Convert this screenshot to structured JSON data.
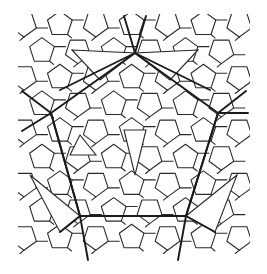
{
  "diagram": {
    "kind": "pentagonal-quasiperiodic-tiling",
    "background": "#ffffff",
    "line_color": "#1a1a1a",
    "heavy_skeleton": {
      "pentagon": [
        [
          135,
          53
        ],
        [
          218,
          113
        ],
        [
          186,
          216
        ],
        [
          80,
          216
        ],
        [
          51,
          113
        ]
      ],
      "spokes": [
        [
          [
            135,
            53
          ],
          [
            124,
            16
          ]
        ],
        [
          [
            135,
            53
          ],
          [
            146,
            16
          ]
        ],
        [
          [
            51,
            113
          ],
          [
            22,
            91
          ]
        ],
        [
          [
            51,
            113
          ],
          [
            22,
            131
          ]
        ],
        [
          [
            218,
            113
          ],
          [
            246,
            91
          ]
        ],
        [
          [
            218,
            113
          ],
          [
            248,
            113
          ]
        ],
        [
          [
            80,
            216
          ],
          [
            60,
            232
          ]
        ],
        [
          [
            80,
            216
          ],
          [
            88,
            260
          ]
        ],
        [
          [
            186,
            216
          ],
          [
            178,
            260
          ]
        ],
        [
          [
            186,
            216
          ],
          [
            215,
            232
          ]
        ],
        [
          [
            135,
            53
          ],
          [
            60,
            90
          ]
        ],
        [
          [
            135,
            53
          ],
          [
            210,
            90
          ]
        ],
        [
          [
            51,
            113
          ],
          [
            80,
            216
          ]
        ],
        [
          [
            218,
            113
          ],
          [
            186,
            216
          ]
        ],
        [
          [
            80,
            216
          ],
          [
            186,
            216
          ]
        ]
      ],
      "thin_triangles": [
        [
          [
            72,
            50
          ],
          [
            135,
            53
          ],
          [
            100,
            80
          ]
        ],
        [
          [
            198,
            50
          ],
          [
            135,
            53
          ],
          [
            170,
            80
          ]
        ],
        [
          [
            30,
            175
          ],
          [
            80,
            216
          ],
          [
            60,
            232
          ]
        ],
        [
          [
            237,
            175
          ],
          [
            186,
            216
          ],
          [
            215,
            232
          ]
        ],
        [
          [
            124,
            130
          ],
          [
            135,
            175
          ],
          [
            146,
            130
          ]
        ],
        [
          [
            70,
            155
          ],
          [
            96,
            155
          ],
          [
            80,
            135
          ]
        ]
      ]
    },
    "pentagon_size": 13
  }
}
